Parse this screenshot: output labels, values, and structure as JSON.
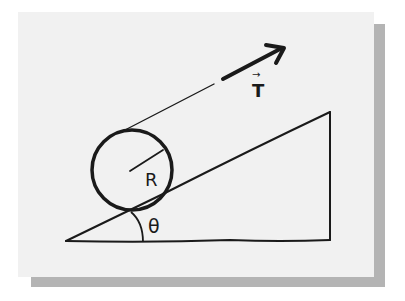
{
  "diagram": {
    "labels": {
      "tension": "T",
      "tension_vector_marker": "→",
      "radius": "R",
      "angle": "θ"
    },
    "elements": [
      {
        "name": "incline-wedge",
        "description": "Right-triangle wedge with hypotenuse rising to the right"
      },
      {
        "name": "cylinder",
        "description": "Circle of radius R resting on the incline"
      },
      {
        "name": "radius-line",
        "description": "Line from circle center to rim labeled R"
      },
      {
        "name": "string",
        "description": "Thin line from top of cylinder parallel to incline"
      },
      {
        "name": "tension-arrow",
        "description": "Thick arrow indicating tension force T, parallel to incline"
      },
      {
        "name": "angle-arc",
        "description": "Arc at base of incline marking angle θ"
      }
    ],
    "colors": {
      "ink": "#1a1a1a",
      "panel": "#f1f1f1",
      "shadow": "#b4b4b4",
      "background": "#ffffff"
    }
  }
}
